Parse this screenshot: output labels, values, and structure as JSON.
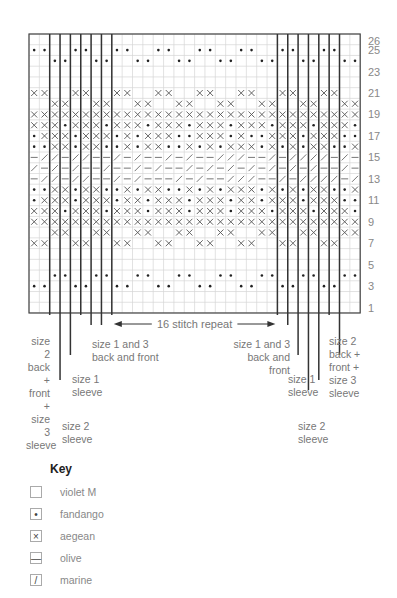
{
  "chart_data": {
    "type": "knitting-chart",
    "columns": 32,
    "rows": 26,
    "row_numbers": [
      "26",
      "25",
      "23",
      "21",
      "19",
      "17",
      "15",
      "13",
      "11",
      "9",
      "7",
      "5",
      "3",
      "1"
    ],
    "thick_lines_after_columns": [
      2,
      3,
      4,
      5,
      6,
      7,
      8,
      24,
      25,
      26,
      27,
      28,
      29,
      30
    ],
    "grid_rows_top_to_bottom": [
      "................................",
      "oo..oo..oo..oo..oo..oo..oo..oo..",
      "..oo..oo..oo..oo..oo..oo..oo..oo",
      "................................",
      "................................",
      "xx..xx..xx..xx..xx..xx..xx..xx..",
      "..xx..xx..xx..xx..xx..xx..xx..xx",
      "xxxxxxxxxxxxxxxxxxxxxxxxxxxxxxxx",
      "xxxoxxxoxxxoxxxoxxxoxxxoxxxoxxxo",
      "oxxxoxxxoxoxxxooxxxoxooxxxoxxxoo",
      "ooxxoxxooxoxxooxoxoxxxoxoxoxxoox",
      "-//-//--/-/--/-/--///--/-////-/-",
      "/-/-/--/--/-/--/-/-/-/-/-/-/--/-",
      "-//-//--/-/---/-/--///--/-////-/",
      "ooxxoxxooxoxxooxoxoxxxoxoxoxxoox",
      "oxxxoxxxoxxoxxxoxxxoxxoxxxoxxxoo",
      "xxxoxxxoxxxoxxxoxxxoxxxoxxxoxxxo",
      "xxxxxxxxxxxxxxxxxxxxxxxxxxxxxxxx",
      "..xx..xx..xx..xx..xx..xx..xx..xx",
      "xx..xx..xx..xx..xx..xx..xx..xx..",
      "................................",
      "................................",
      "..oo..oo..oo..oo..oo..oo..oo..oo",
      "oo..oo..oo..oo..oo..oo..oo..oo..",
      "................................",
      "................................"
    ],
    "symbols": {
      ".": "violet M",
      "o": "fandango",
      "x": "aegean",
      "-": "olive",
      "/": "marine"
    },
    "repeat_label": "16 stitch repeat"
  },
  "labels": {
    "left_size2": [
      "size 2",
      "back +",
      "front +",
      "size 3",
      "sleeve"
    ],
    "left_size1_sleeve": [
      "size 1",
      "sleeve"
    ],
    "left_size2_sleeve": [
      "size 2",
      "sleeve"
    ],
    "left_size13": [
      "size 1 and 3",
      "back and front"
    ],
    "right_size13": [
      "size 1 and 3",
      "back and front"
    ],
    "right_size1_sleeve": [
      "size 1",
      "sleeve"
    ],
    "right_size2_sleeve": [
      "size 2",
      "sleeve"
    ],
    "right_size2": [
      "size 2",
      "back +",
      "front +",
      "size 3",
      "sleeve"
    ]
  },
  "key": {
    "title": "Key",
    "items": [
      {
        "symbol": "",
        "label": "violet M"
      },
      {
        "symbol": "•",
        "label": "fandango"
      },
      {
        "symbol": "×",
        "label": "aegean"
      },
      {
        "symbol": "—",
        "label": "olive"
      },
      {
        "symbol": "/",
        "label": "marine"
      }
    ]
  }
}
